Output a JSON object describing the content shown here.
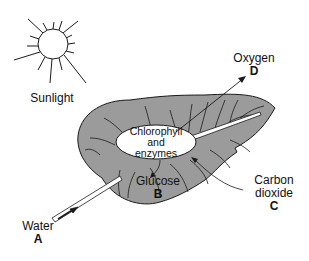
{
  "diagram": {
    "colors": {
      "leaf_fill": "#9b9b9b",
      "stroke": "#1a1a1a",
      "background": "#ffffff",
      "ellipse_fill": "#ffffff"
    },
    "sun": {
      "label": "Sunlight"
    },
    "center": {
      "line1": "Chlorophyll",
      "line2": "and",
      "line3": "enzymes"
    },
    "labels": {
      "water": {
        "name": "Water",
        "letter": "A"
      },
      "glucose": {
        "name": "Glucose",
        "letter": "B"
      },
      "carbon_dioxide": {
        "name_line1": "Carbon",
        "name_line2": "dioxide",
        "letter": "C"
      },
      "oxygen": {
        "name": "Oxygen",
        "letter": "D"
      }
    }
  }
}
